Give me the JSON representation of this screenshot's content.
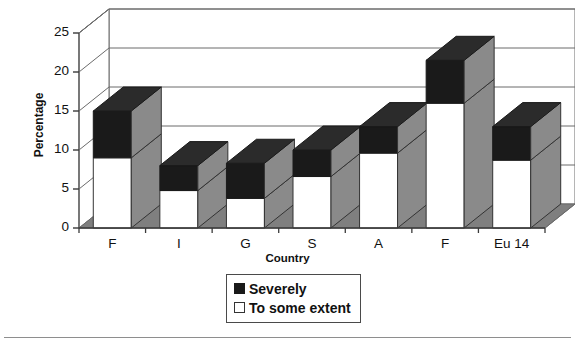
{
  "chart_data": {
    "type": "bar",
    "subtype": "stacked-column-3d",
    "title": "",
    "xlabel": "Country",
    "ylabel": "Percentage",
    "categories": [
      "F",
      "I",
      "G",
      "S",
      "A",
      "F",
      "Eu 14"
    ],
    "yticks": [
      0,
      5,
      10,
      15,
      20,
      25
    ],
    "ylim": [
      0,
      25
    ],
    "grid": true,
    "legend_position": "bottom-center",
    "series": [
      {
        "name": "To some extent",
        "color": "#ffffff",
        "values": [
          9.0,
          4.8,
          3.8,
          6.6,
          9.6,
          16.0,
          8.7
        ]
      },
      {
        "name": "Severely",
        "color": "#1a1a1a",
        "values": [
          6.0,
          3.2,
          4.5,
          3.4,
          3.4,
          5.5,
          4.3
        ]
      }
    ],
    "totals": [
      15.0,
      8.0,
      8.3,
      10.0,
      13.0,
      21.5,
      13.0
    ]
  },
  "axes": {
    "ylabel": "Percentage",
    "xlabel": "Country",
    "ytick_labels": [
      "25",
      "20",
      "15",
      "10",
      "5",
      "0"
    ],
    "xtick_labels": [
      "F",
      "I",
      "G",
      "S",
      "A",
      "F",
      "Eu 14"
    ]
  },
  "legend": {
    "items": [
      {
        "label": "Severely",
        "swatch": "dark-square-icon"
      },
      {
        "label": "To some extent",
        "swatch": "light-square-icon"
      }
    ]
  },
  "colors": {
    "series_severely": "#1a1a1a",
    "series_to_some_extent": "#ffffff",
    "bar_side": "#8a8a8a",
    "floor": "#7f7f7f",
    "frame": "#6b6b6b",
    "text": "#111111"
  }
}
